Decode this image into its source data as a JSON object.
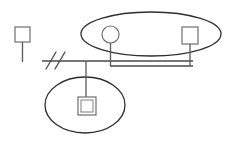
{
  "diagram": {
    "type": "kinship-diagram",
    "background_color": "#ffffff",
    "line_color": "#4a4a4a",
    "ellipse_color": "#2e2e2e",
    "node_stroke_color": "#6e6e6e",
    "node_fill_color": "#ffffff",
    "canvas": {
      "width": 233,
      "height": 144
    },
    "groups": [
      {
        "id": "upper-group",
        "shape": "ellipse",
        "label": "",
        "cx": 151,
        "cy": 34,
        "rx": 70,
        "ry": 22,
        "contains": [
          "female-node",
          "male-node-right"
        ]
      },
      {
        "id": "lower-group",
        "shape": "ellipse",
        "label": "",
        "cx": 85,
        "cy": 105,
        "rx": 40,
        "ry": 28,
        "contains": [
          "nested-square-node"
        ]
      }
    ],
    "nodes": [
      {
        "id": "male-node-left",
        "symbol": "square",
        "label": "",
        "x": 15,
        "y": 27,
        "size": 15,
        "stem": {
          "from_y": 42,
          "to_y": 62
        }
      },
      {
        "id": "female-node",
        "symbol": "circle",
        "label": "",
        "cx": 110.5,
        "cy": 34.5,
        "r": 8.5,
        "stem": {
          "from_y": 43,
          "to_y": 61
        }
      },
      {
        "id": "male-node-right",
        "symbol": "square",
        "label": "",
        "x": 182,
        "y": 27,
        "size": 16,
        "stem": {
          "from_y": 43,
          "to_y": 61
        }
      },
      {
        "id": "nested-square-node",
        "symbol": "nested-square",
        "label": "",
        "x": 78,
        "y": 97,
        "size": 18,
        "inner_inset": 3,
        "stem": {
          "from_y": 61,
          "to_y": 97
        }
      }
    ],
    "connectors": [
      {
        "id": "main-descent-line",
        "orientation": "horizontal",
        "x1": 42,
        "x2": 193,
        "y": 61
      },
      {
        "id": "right-return-line",
        "orientation": "horizontal",
        "x1": 110,
        "x2": 193,
        "y": 66
      }
    ],
    "break_symbol": {
      "id": "line-break-marker",
      "glyph": "//",
      "count": 2,
      "x": 46,
      "y": 53,
      "length": 16,
      "spacing": 8
    }
  }
}
